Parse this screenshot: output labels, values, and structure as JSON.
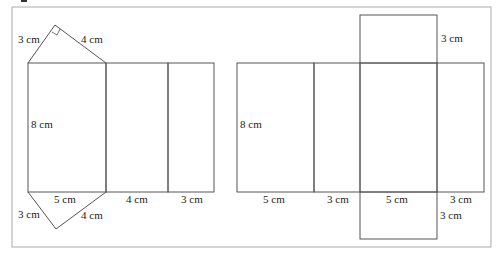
{
  "diagram": {
    "title_fragment": "",
    "left_net": {
      "name": "triangular prism net",
      "labels": {
        "top_tri_left": "3 cm",
        "top_tri_right": "4 cm",
        "height": "8 cm",
        "bot_tri_base": "5 cm",
        "bot_tri_left": "3 cm",
        "bot_tri_right": "4 cm",
        "rect2_width": "4 cm",
        "rect3_width": "3 cm"
      }
    },
    "right_net": {
      "name": "rectangular prism net",
      "labels": {
        "top_flap": "3 cm",
        "height": "8 cm",
        "rect1_width": "5 cm",
        "rect2_width": "3 cm",
        "rect3_width": "5 cm",
        "rect4_width": "3 cm",
        "bottom_flap": "3 cm"
      }
    },
    "colors": {
      "line": "#555555",
      "border": "#999999",
      "text": "#222222"
    }
  }
}
